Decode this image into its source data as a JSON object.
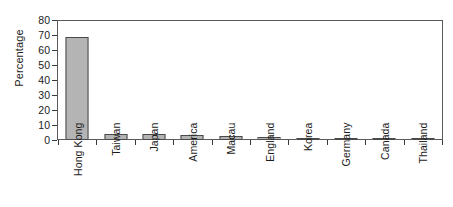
{
  "chart_data": {
    "type": "bar",
    "title": "",
    "subtitle": "",
    "xlabel": "",
    "ylabel": "Percentage",
    "ylim": [
      0,
      80
    ],
    "ytick_step": 10,
    "yticks": [
      "80",
      "70",
      "60",
      "50",
      "40",
      "30",
      "20",
      "10",
      "0"
    ],
    "grid": false,
    "legend": null,
    "orientation": "vertical",
    "bar_fill_color": "#b4b4b4",
    "bar_edge_color": "#4a4a4a",
    "axis_color": "#5a5a5a",
    "text_color": "#1c1c1c",
    "background_color": "#ffffff",
    "xtick_label_rotation": 90,
    "categories": [
      "Hong Kong",
      "Taiwan",
      "Japan",
      "America",
      "Macau",
      "England",
      "Korea",
      "Germany",
      "Canada",
      "Thailand"
    ],
    "values": [
      69,
      4,
      4,
      3.5,
      3,
      2,
      1,
      1,
      1,
      1
    ]
  }
}
